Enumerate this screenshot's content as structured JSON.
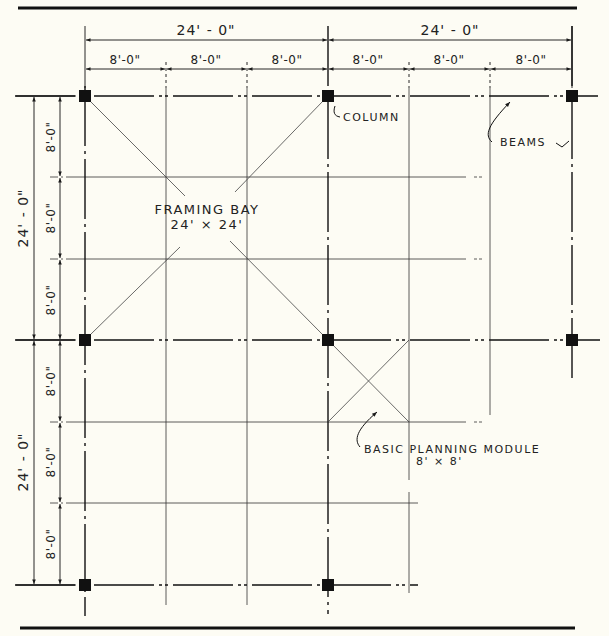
{
  "diagram": {
    "type": "structural framing plan",
    "colors": {
      "background": "#fdfcf4",
      "ink": "#1a1a1a",
      "column": "#111111"
    },
    "top_dimensions": {
      "overall": [
        {
          "label": "24' - 0\""
        },
        {
          "label": "24' - 0\""
        }
      ],
      "modules": [
        {
          "label": "8'-0\""
        },
        {
          "label": "8'-0\""
        },
        {
          "label": "8'-0\""
        },
        {
          "label": "8'-0\""
        },
        {
          "label": "8'-0\""
        },
        {
          "label": "8'-0\""
        }
      ]
    },
    "left_dimensions": {
      "overall": [
        {
          "label": "24' - 0\""
        },
        {
          "label": "24' - 0\""
        }
      ],
      "modules": [
        {
          "label": "8'-0\""
        },
        {
          "label": "8'-0\""
        },
        {
          "label": "8'-0\""
        },
        {
          "label": "8'-0\""
        },
        {
          "label": "8'-0\""
        },
        {
          "label": "8'-0\""
        }
      ]
    },
    "annotations": {
      "column": "COLUMN",
      "beams": "BEAMS",
      "framing_bay_title": "FRAMING BAY",
      "framing_bay_size": "24' × 24'",
      "module_title": "BASIC PLANNING MODULE",
      "module_size": "8' × 8'"
    },
    "grid": {
      "columns_x": [
        85,
        328,
        572
      ],
      "columns_y": [
        96,
        340,
        585
      ],
      "module_lines_x": [
        85,
        166,
        247,
        328,
        409,
        490,
        572
      ],
      "module_lines_y": [
        96,
        177,
        259,
        340,
        422,
        503,
        585
      ]
    }
  }
}
